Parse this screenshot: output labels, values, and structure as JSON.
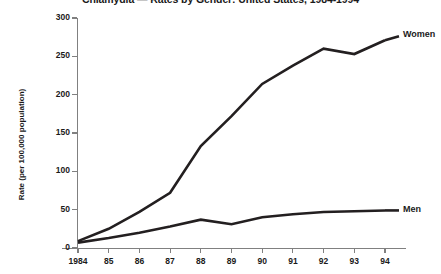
{
  "chart_data": {
    "type": "line",
    "title": "Chlamydia — Rates by Gender: United States, 1984-1994",
    "xlabel": "",
    "ylabel": "Rate (per 100,000 population)",
    "categories": [
      "1984",
      "85",
      "86",
      "87",
      "88",
      "89",
      "90",
      "91",
      "92",
      "93",
      "94"
    ],
    "x_values": [
      1984,
      1985,
      1986,
      1987,
      1988,
      1989,
      1990,
      1991,
      1992,
      1993,
      1994
    ],
    "xlim": [
      1984,
      1994
    ],
    "ylim": [
      0,
      300
    ],
    "y_ticks": [
      0,
      50,
      100,
      150,
      200,
      250,
      300
    ],
    "y_tick_labels": [
      "0",
      "50",
      "100",
      "150",
      "200",
      "250",
      "300"
    ],
    "grid": false,
    "legend_position": "right-inline-labels",
    "series": [
      {
        "name": "Women",
        "color": "#231f20",
        "values": [
          9,
          25,
          47,
          72,
          133,
          172,
          214,
          238,
          260,
          253,
          271
        ]
      },
      {
        "name": "Men",
        "color": "#231f20",
        "values": [
          7,
          13,
          20,
          28,
          37,
          31,
          40,
          44,
          47,
          48,
          49
        ]
      }
    ],
    "annotations": [
      {
        "text": "Women",
        "series": "Women"
      },
      {
        "text": "Men",
        "series": "Men"
      }
    ]
  }
}
